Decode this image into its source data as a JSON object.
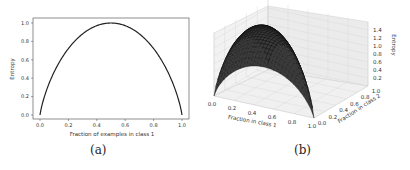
{
  "chart_data": [
    {
      "type": "line",
      "panel": "a",
      "title": "",
      "xlabel": "Fraction of examples in class 1",
      "ylabel": "Entropy",
      "xlim": [
        0.0,
        1.0
      ],
      "ylim": [
        0.0,
        1.0
      ],
      "xticks": [
        "0.0",
        "0.2",
        "0.4",
        "0.6",
        "0.8",
        "1.0"
      ],
      "yticks": [
        "0.0",
        "0.2",
        "0.4",
        "0.6",
        "0.8",
        "1.0"
      ],
      "grid": false,
      "series": [
        {
          "name": "Binary entropy",
          "x": [
            0.0,
            0.05,
            0.1,
            0.2,
            0.3,
            0.4,
            0.5,
            0.6,
            0.7,
            0.8,
            0.9,
            0.95,
            1.0
          ],
          "y": [
            0.0,
            0.286,
            0.469,
            0.722,
            0.881,
            0.971,
            1.0,
            0.971,
            0.881,
            0.722,
            0.469,
            0.286,
            0.0
          ]
        }
      ],
      "caption": "(a)"
    },
    {
      "type": "surface",
      "panel": "b",
      "title": "",
      "xlabel": "Fraction in class 1",
      "ylabel": "Fraction in class 2",
      "zlabel": "Entropy",
      "xticks": [
        "0.0",
        "0.2",
        "0.4",
        "0.6",
        "0.8",
        "1.0"
      ],
      "yticks": [
        "0.0",
        "0.2",
        "0.4",
        "0.6",
        "0.8",
        "1.0"
      ],
      "zticks": [
        "0.2",
        "0.4",
        "0.6",
        "0.8",
        "1.0",
        "1.2",
        "1.4"
      ],
      "zlim": [
        0.0,
        1.585
      ],
      "grid": true,
      "description": "Three-class entropy surface, peak ~1.58 at (1/3, 1/3), zero at the corners",
      "caption": "(b)"
    }
  ]
}
